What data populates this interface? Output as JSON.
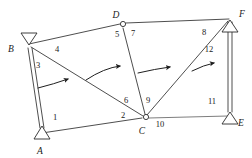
{
  "figure": {
    "kind": "truss-diagram",
    "title": "",
    "background_color": "#ffffff",
    "line_color": "#3a3a3a",
    "label_color": "#1a1a1a"
  },
  "nodes": [
    {
      "id": "A",
      "label": "A",
      "x": 42,
      "y": 133,
      "support": "pin-triangle",
      "label_x": 40,
      "label_y": 153
    },
    {
      "id": "B",
      "label": "B",
      "x": 29,
      "y": 44,
      "support": "pin-triangle",
      "label_x": 9,
      "label_y": 51
    },
    {
      "id": "C",
      "label": "C",
      "x": 145,
      "y": 117,
      "support": "hinge-circle",
      "label_x": 140,
      "label_y": 133
    },
    {
      "id": "D",
      "label": "D",
      "x": 122,
      "y": 24,
      "support": "hinge-circle",
      "label_x": 113,
      "label_y": 17
    },
    {
      "id": "E",
      "label": "E",
      "x": 231,
      "y": 116,
      "support": "pin-triangle",
      "label_x": 238,
      "label_y": 124
    },
    {
      "id": "F",
      "label": "F",
      "x": 231,
      "y": 17,
      "support": "pin-triangle",
      "label_x": 238,
      "label_y": 16
    }
  ],
  "members": [
    {
      "id": 1,
      "label": "1",
      "from": "B",
      "to": "A",
      "double": true,
      "label_x": 55,
      "label_y": 120
    },
    {
      "id": 2,
      "label": "2",
      "from": "A",
      "to": "C",
      "double": false,
      "label_x": 122,
      "label_y": 118
    },
    {
      "id": 3,
      "label": "3",
      "from": "B",
      "to": "A",
      "double": true,
      "label_x": 38,
      "label_y": 67
    },
    {
      "id": 4,
      "label": "4",
      "from": "B",
      "to": "D",
      "double": false,
      "label_x": 56,
      "label_y": 51
    },
    {
      "id": 5,
      "label": "5",
      "from": "D",
      "to": "B",
      "double": false,
      "label_x": 115,
      "label_y": 36
    },
    {
      "id": 6,
      "label": "6",
      "from": "B",
      "to": "C",
      "double": false,
      "label_x": 125,
      "label_y": 102
    },
    {
      "id": 7,
      "label": "7",
      "from": "D",
      "to": "C",
      "double": false,
      "label_x": 131,
      "label_y": 35
    },
    {
      "id": 8,
      "label": "8",
      "from": "D",
      "to": "F",
      "double": false,
      "label_x": 203,
      "label_y": 34
    },
    {
      "id": 9,
      "label": "9",
      "from": "C",
      "to": "D",
      "double": false,
      "label_x": 147,
      "label_y": 102
    },
    {
      "id": 10,
      "label": "10",
      "from": "C",
      "to": "E",
      "double": false,
      "label_x": 158,
      "label_y": 126
    },
    {
      "id": 11,
      "label": "11",
      "from": "F",
      "to": "E",
      "double": true,
      "label_x": 211,
      "label_y": 103
    },
    {
      "id": 12,
      "label": "12",
      "from": "C",
      "to": "F",
      "double": false,
      "label_x": 208,
      "label_y": 51
    }
  ],
  "load_arrows": [
    {
      "id": "arrow-1",
      "label": "",
      "path": "M 38 87 Q 54 83 70 79"
    },
    {
      "id": "arrow-2",
      "label": "",
      "path": "M 86 79 Q 104 68 122 65"
    },
    {
      "id": "arrow-3",
      "label": "",
      "path": "M 138 72 Q 155 68 172 66"
    },
    {
      "id": "arrow-4",
      "label": "",
      "path": "M 192 70 Q 204 64 216 62"
    }
  ],
  "member_label_values": [
    "1",
    "2",
    "3",
    "4",
    "5",
    "6",
    "7",
    "8",
    "9",
    "10",
    "11",
    "12"
  ],
  "node_label_values": [
    "A",
    "B",
    "C",
    "D",
    "E",
    "F"
  ]
}
